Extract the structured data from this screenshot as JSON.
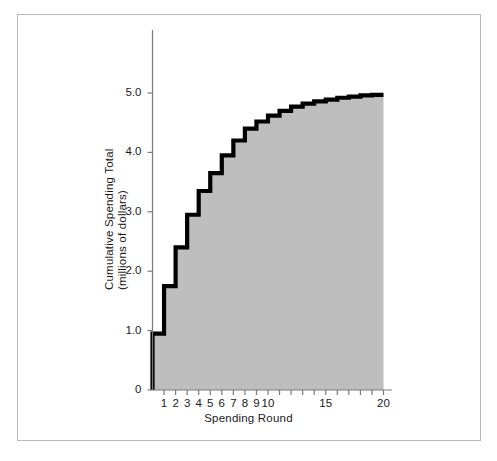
{
  "chart_data": {
    "type": "area",
    "title": "",
    "xlabel": "Spending Round",
    "ylabel": "Cumulative Spending Total\n(millions of dollars)",
    "ylabel_line1": "Cumulative Spending Total",
    "ylabel_line2": "(millions of dollars)",
    "x": [
      1,
      2,
      3,
      4,
      5,
      6,
      7,
      8,
      9,
      10,
      11,
      12,
      13,
      14,
      15,
      16,
      17,
      18,
      19,
      20
    ],
    "values": [
      0.95,
      1.75,
      2.4,
      2.95,
      3.35,
      3.65,
      3.95,
      4.2,
      4.4,
      4.52,
      4.62,
      4.7,
      4.77,
      4.82,
      4.86,
      4.89,
      4.92,
      4.94,
      4.96,
      4.97
    ],
    "categories": [
      "1",
      "2",
      "3",
      "4",
      "5",
      "6",
      "7",
      "8",
      "9",
      "10",
      "11",
      "12",
      "13",
      "14",
      "15",
      "16",
      "17",
      "18",
      "19",
      "20"
    ],
    "xlim": [
      0,
      20.4
    ],
    "ylim": [
      0,
      5.95
    ],
    "xticks": [
      1,
      2,
      3,
      4,
      5,
      6,
      7,
      8,
      9,
      10,
      11,
      12,
      13,
      14,
      15,
      16,
      17,
      18,
      19,
      20
    ],
    "xtick_labels_shown": [
      {
        "value": 1,
        "label": "1"
      },
      {
        "value": 2,
        "label": "2"
      },
      {
        "value": 3,
        "label": "3"
      },
      {
        "value": 4,
        "label": "4"
      },
      {
        "value": 5,
        "label": "5"
      },
      {
        "value": 6,
        "label": "6"
      },
      {
        "value": 7,
        "label": "7"
      },
      {
        "value": 8,
        "label": "8"
      },
      {
        "value": 9,
        "label": "9"
      },
      {
        "value": 10,
        "label": "10"
      },
      {
        "value": 15,
        "label": "15"
      },
      {
        "value": 20,
        "label": "20"
      }
    ],
    "yticks": [
      0,
      1.0,
      2.0,
      3.0,
      4.0,
      5.0
    ],
    "ytick_labels": [
      "0",
      "1.0",
      "2.0",
      "3.0",
      "4.0",
      "5.0"
    ],
    "grid": false,
    "legend": null,
    "step_style": "post",
    "fill_color": "#bebebe",
    "line_color": "#000000",
    "axis_color": "#7a7a7a",
    "frame_color": "#b9b9b9",
    "background": "#ffffff"
  },
  "axes": {
    "x_title": "Spending Round",
    "y_title_line1": "Cumulative Spending Total",
    "y_title_line2": "(millions of dollars)"
  }
}
